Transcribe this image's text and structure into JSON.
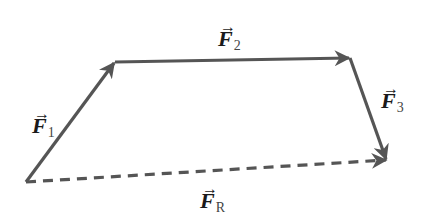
{
  "diagram": {
    "colors": {
      "vector": "#555555",
      "label": "#1a1a1a"
    },
    "points": {
      "origin": [
        26,
        182
      ],
      "a": [
        115,
        62
      ],
      "b": [
        350,
        58
      ],
      "c": [
        387,
        160
      ]
    },
    "vectors": [
      {
        "id": "F1",
        "name": "F",
        "subscript": "1",
        "arrow": "→",
        "style": "solid"
      },
      {
        "id": "F2",
        "name": "F",
        "subscript": "2",
        "arrow": "→",
        "style": "solid"
      },
      {
        "id": "F3",
        "name": "F",
        "subscript": "3",
        "arrow": "→",
        "style": "solid"
      },
      {
        "id": "FR",
        "name": "F",
        "subscript": "R",
        "arrow": "→",
        "style": "dashed"
      }
    ]
  }
}
